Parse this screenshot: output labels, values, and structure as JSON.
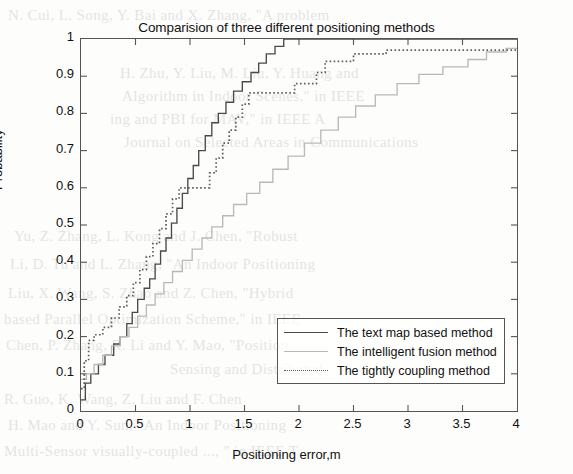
{
  "figure": {
    "title": "Comparision of three different positioning methods",
    "xlabel": "Positioning error,m",
    "ylabel": "Probability"
  },
  "legend": {
    "items": [
      {
        "label": "The text map based method",
        "style": "solid",
        "color": "#4a4a4a"
      },
      {
        "label": "The intelligent fusion method",
        "style": "light-solid",
        "color": "#b9b9b9"
      },
      {
        "label": "The tightly coupling method",
        "style": "dotted",
        "color": "#5d5d5d"
      }
    ]
  },
  "background_text": [
    {
      "text": "N. Cui, L. Song, Y. Bai and X. Zhang, \"A problem",
      "x": 8,
      "y": 4
    },
    {
      "text": "H. Zhu, Y. Liu, M. Liu, Y. Huang and",
      "x": 120,
      "y": 62
    },
    {
      "text": "Algorithm in Indoor Scenes,\" in IEEE",
      "x": 122,
      "y": 85
    },
    {
      "text": "ing and PBI for MAV,\" in IEEE A",
      "x": 110,
      "y": 108
    },
    {
      "text": "Journal on Selected Areas in Communications",
      "x": 124,
      "y": 131
    },
    {
      "text": "Yu, Z. Zhang, L. Kong and J. Chen, \"Robust",
      "x": 14,
      "y": 225
    },
    {
      "text": "Li, D. Tu and L. Zhang, \"An Indoor Positioning",
      "x": 10,
      "y": 253
    },
    {
      "text": "Liu, X. Wang, S. Zhao and Z. Chen, \"Hybrid",
      "x": 8,
      "y": 282
    },
    {
      "text": "based Parallel Optimization Scheme,\" in IEEE",
      "x": 4,
      "y": 308
    },
    {
      "text": "Chen, P. Zhang, R. Li and Y. Mao, \"Position",
      "x": 6,
      "y": 334
    },
    {
      "text": "Sensing and Distributed",
      "x": 170,
      "y": 358
    },
    {
      "text": "R. Guo, K. Wang, Z. Liu and F. Chen",
      "x": 4,
      "y": 388
    },
    {
      "text": "H. Mao and Y. Sun, \"An Indoor Positioning",
      "x": 8,
      "y": 414
    },
    {
      "text": "Multi-Sensor visually-coupled ..., \" in IEEE T",
      "x": 4,
      "y": 440
    }
  ],
  "chart_data": {
    "type": "line",
    "title": "Comparision of three different positioning methods",
    "xlabel": "Positioning error,m",
    "ylabel": "Probability",
    "xlim": [
      0,
      4
    ],
    "ylim": [
      0,
      1
    ],
    "xticks": [
      0,
      0.5,
      1,
      1.5,
      2,
      2.5,
      3,
      3.5,
      4
    ],
    "xtick_labels": [
      "0",
      "0.5",
      "1",
      "1.5",
      "2",
      "2.5",
      "3",
      "3.5",
      "4"
    ],
    "yticks": [
      0,
      0.1,
      0.2,
      0.3,
      0.4,
      0.5,
      0.6,
      0.7,
      0.8,
      0.9,
      1
    ],
    "ytick_labels": [
      "0",
      "0.1",
      "0.2",
      "0.3",
      "0.4",
      "0.5",
      "0.6",
      "0.7",
      "0.8",
      "0.9",
      "1"
    ],
    "grid": false,
    "legend_position": "lower right",
    "series": [
      {
        "name": "The text map based method",
        "style": "solid",
        "color": "#4a4a4a",
        "points": [
          [
            0.0,
            0.03
          ],
          [
            0.04,
            0.03
          ],
          [
            0.04,
            0.075
          ],
          [
            0.09,
            0.075
          ],
          [
            0.09,
            0.1
          ],
          [
            0.16,
            0.1
          ],
          [
            0.16,
            0.125
          ],
          [
            0.22,
            0.125
          ],
          [
            0.22,
            0.15
          ],
          [
            0.3,
            0.15
          ],
          [
            0.3,
            0.18
          ],
          [
            0.36,
            0.18
          ],
          [
            0.36,
            0.2
          ],
          [
            0.42,
            0.2
          ],
          [
            0.42,
            0.235
          ],
          [
            0.47,
            0.235
          ],
          [
            0.47,
            0.265
          ],
          [
            0.52,
            0.265
          ],
          [
            0.52,
            0.3
          ],
          [
            0.58,
            0.3
          ],
          [
            0.58,
            0.33
          ],
          [
            0.63,
            0.33
          ],
          [
            0.63,
            0.355
          ],
          [
            0.68,
            0.355
          ],
          [
            0.68,
            0.395
          ],
          [
            0.73,
            0.395
          ],
          [
            0.73,
            0.43
          ],
          [
            0.78,
            0.43
          ],
          [
            0.78,
            0.465
          ],
          [
            0.83,
            0.465
          ],
          [
            0.83,
            0.505
          ],
          [
            0.88,
            0.505
          ],
          [
            0.88,
            0.545
          ],
          [
            0.93,
            0.545
          ],
          [
            0.93,
            0.585
          ],
          [
            0.98,
            0.585
          ],
          [
            0.98,
            0.625
          ],
          [
            1.03,
            0.625
          ],
          [
            1.03,
            0.66
          ],
          [
            1.08,
            0.66
          ],
          [
            1.08,
            0.7
          ],
          [
            1.14,
            0.7
          ],
          [
            1.14,
            0.74
          ],
          [
            1.2,
            0.74
          ],
          [
            1.2,
            0.775
          ],
          [
            1.26,
            0.775
          ],
          [
            1.26,
            0.8
          ],
          [
            1.33,
            0.8
          ],
          [
            1.33,
            0.83
          ],
          [
            1.4,
            0.83
          ],
          [
            1.4,
            0.86
          ],
          [
            1.48,
            0.86
          ],
          [
            1.48,
            0.885
          ],
          [
            1.56,
            0.885
          ],
          [
            1.56,
            0.91
          ],
          [
            1.63,
            0.91
          ],
          [
            1.63,
            0.935
          ],
          [
            1.7,
            0.935
          ],
          [
            1.7,
            0.96
          ],
          [
            1.78,
            0.96
          ],
          [
            1.78,
            0.98
          ],
          [
            1.86,
            0.98
          ],
          [
            1.86,
            1.0
          ],
          [
            4.0,
            1.0
          ]
        ]
      },
      {
        "name": "The intelligent fusion method",
        "style": "solid",
        "color": "#b9b9b9",
        "points": [
          [
            0.0,
            0.085
          ],
          [
            0.05,
            0.085
          ],
          [
            0.05,
            0.1
          ],
          [
            0.12,
            0.1
          ],
          [
            0.12,
            0.125
          ],
          [
            0.2,
            0.125
          ],
          [
            0.2,
            0.15
          ],
          [
            0.28,
            0.15
          ],
          [
            0.28,
            0.175
          ],
          [
            0.36,
            0.175
          ],
          [
            0.36,
            0.2
          ],
          [
            0.44,
            0.2
          ],
          [
            0.44,
            0.225
          ],
          [
            0.52,
            0.225
          ],
          [
            0.52,
            0.255
          ],
          [
            0.6,
            0.255
          ],
          [
            0.6,
            0.285
          ],
          [
            0.68,
            0.285
          ],
          [
            0.68,
            0.315
          ],
          [
            0.76,
            0.315
          ],
          [
            0.76,
            0.345
          ],
          [
            0.84,
            0.345
          ],
          [
            0.84,
            0.375
          ],
          [
            0.93,
            0.375
          ],
          [
            0.93,
            0.405
          ],
          [
            1.02,
            0.405
          ],
          [
            1.02,
            0.435
          ],
          [
            1.11,
            0.435
          ],
          [
            1.11,
            0.465
          ],
          [
            1.2,
            0.465
          ],
          [
            1.2,
            0.495
          ],
          [
            1.3,
            0.495
          ],
          [
            1.3,
            0.525
          ],
          [
            1.4,
            0.525
          ],
          [
            1.4,
            0.555
          ],
          [
            1.52,
            0.555
          ],
          [
            1.52,
            0.585
          ],
          [
            1.64,
            0.585
          ],
          [
            1.64,
            0.615
          ],
          [
            1.76,
            0.615
          ],
          [
            1.76,
            0.65
          ],
          [
            1.9,
            0.65
          ],
          [
            1.9,
            0.685
          ],
          [
            2.05,
            0.685
          ],
          [
            2.05,
            0.72
          ],
          [
            2.2,
            0.72
          ],
          [
            2.2,
            0.755
          ],
          [
            2.36,
            0.755
          ],
          [
            2.36,
            0.79
          ],
          [
            2.52,
            0.79
          ],
          [
            2.52,
            0.82
          ],
          [
            2.7,
            0.82
          ],
          [
            2.7,
            0.85
          ],
          [
            2.9,
            0.85
          ],
          [
            2.9,
            0.88
          ],
          [
            3.1,
            0.88
          ],
          [
            3.1,
            0.905
          ],
          [
            3.32,
            0.905
          ],
          [
            3.32,
            0.925
          ],
          [
            3.55,
            0.925
          ],
          [
            3.55,
            0.945
          ],
          [
            3.72,
            0.945
          ],
          [
            3.72,
            0.965
          ],
          [
            3.9,
            0.965
          ],
          [
            3.9,
            0.975
          ],
          [
            4.0,
            0.975
          ]
        ]
      },
      {
        "name": "The tightly coupling method",
        "style": "dotted",
        "color": "#5d5d5d",
        "points": [
          [
            0.0,
            0.06
          ],
          [
            0.03,
            0.06
          ],
          [
            0.03,
            0.135
          ],
          [
            0.07,
            0.135
          ],
          [
            0.07,
            0.19
          ],
          [
            0.12,
            0.19
          ],
          [
            0.12,
            0.205
          ],
          [
            0.2,
            0.205
          ],
          [
            0.2,
            0.225
          ],
          [
            0.28,
            0.225
          ],
          [
            0.28,
            0.25
          ],
          [
            0.35,
            0.25
          ],
          [
            0.35,
            0.28
          ],
          [
            0.42,
            0.28
          ],
          [
            0.42,
            0.31
          ],
          [
            0.48,
            0.31
          ],
          [
            0.48,
            0.345
          ],
          [
            0.54,
            0.345
          ],
          [
            0.54,
            0.38
          ],
          [
            0.6,
            0.38
          ],
          [
            0.6,
            0.415
          ],
          [
            0.66,
            0.415
          ],
          [
            0.66,
            0.45
          ],
          [
            0.72,
            0.45
          ],
          [
            0.72,
            0.49
          ],
          [
            0.78,
            0.49
          ],
          [
            0.78,
            0.53
          ],
          [
            0.84,
            0.53
          ],
          [
            0.84,
            0.57
          ],
          [
            0.9,
            0.57
          ],
          [
            0.9,
            0.6
          ],
          [
            1.18,
            0.6
          ],
          [
            1.18,
            0.64
          ],
          [
            1.24,
            0.64
          ],
          [
            1.24,
            0.68
          ],
          [
            1.3,
            0.68
          ],
          [
            1.3,
            0.72
          ],
          [
            1.36,
            0.72
          ],
          [
            1.36,
            0.755
          ],
          [
            1.42,
            0.755
          ],
          [
            1.42,
            0.79
          ],
          [
            1.48,
            0.79
          ],
          [
            1.48,
            0.825
          ],
          [
            1.54,
            0.825
          ],
          [
            1.54,
            0.855
          ],
          [
            1.96,
            0.855
          ],
          [
            1.96,
            0.88
          ],
          [
            2.16,
            0.88
          ],
          [
            2.16,
            0.91
          ],
          [
            2.24,
            0.91
          ],
          [
            2.24,
            0.94
          ],
          [
            2.5,
            0.94
          ],
          [
            2.5,
            0.96
          ],
          [
            2.8,
            0.96
          ],
          [
            2.8,
            0.97
          ],
          [
            4.0,
            0.97
          ]
        ]
      }
    ]
  }
}
